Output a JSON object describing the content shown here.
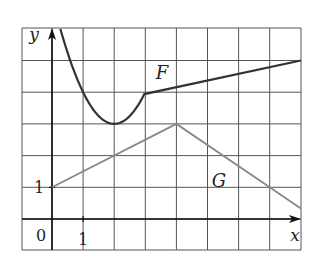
{
  "chart_data": {
    "type": "line",
    "title": "",
    "xlabel": "x",
    "ylabel": "y",
    "xlim": [
      -1,
      8
    ],
    "ylim": [
      -1,
      6
    ],
    "grid": true,
    "grid_step": 1,
    "tick_labels": {
      "origin": "0",
      "x": [
        "1"
      ],
      "y": [
        "1"
      ]
    },
    "series": [
      {
        "name": "F",
        "color": "#333333",
        "description": "Parabola y = 3 + (x-2)^2 for x from ~0.27 to 3, then line from (3,4) to (8,5)",
        "points": [
          [
            0.27,
            6
          ],
          [
            0.5,
            5.25
          ],
          [
            1,
            4
          ],
          [
            1.5,
            3.25
          ],
          [
            2,
            3
          ],
          [
            2.5,
            3.25
          ],
          [
            3,
            4
          ],
          [
            8,
            5
          ]
        ]
      },
      {
        "name": "G",
        "color": "#888888",
        "description": "Piecewise linear: (0,1) to (4,3) then to (8,1/3)",
        "points": [
          [
            0,
            1
          ],
          [
            4,
            3
          ],
          [
            7,
            1
          ],
          [
            8,
            0.333
          ]
        ]
      }
    ],
    "annotations": [
      {
        "text": "F",
        "x": 3.5,
        "y": 4.6
      },
      {
        "text": "G",
        "x": 5.3,
        "y": 1.2
      }
    ]
  },
  "labels": {
    "y_axis": "y",
    "x_axis": "x",
    "origin": "0",
    "x_tick_1": "1",
    "y_tick_1": "1",
    "curve_f": "F",
    "curve_g": "G"
  }
}
